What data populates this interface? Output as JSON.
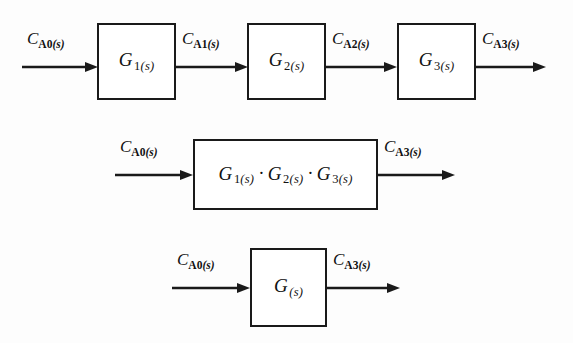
{
  "diagram": {
    "stroke_color": "#1a1a1a",
    "background_color": "#fdfdfd",
    "rows": [
      {
        "id": "row-cascade",
        "blocks": [
          {
            "id": "block-g1",
            "label_main": "G",
            "label_sub_num": "1",
            "label_sub_s": "(s)"
          },
          {
            "id": "block-g2",
            "label_main": "G",
            "label_sub_num": "2",
            "label_sub_s": "(s)"
          },
          {
            "id": "block-g3",
            "label_main": "G",
            "label_sub_num": "3",
            "label_sub_s": "(s)"
          }
        ],
        "signals": [
          {
            "id": "signal-ca0-top",
            "main": "C",
            "sub_bold": "A0",
            "sub_italic": "(s)"
          },
          {
            "id": "signal-ca1",
            "main": "C",
            "sub_bold": "A1",
            "sub_italic": "(s)"
          },
          {
            "id": "signal-ca2",
            "main": "C",
            "sub_bold": "A2",
            "sub_italic": "(s)"
          },
          {
            "id": "signal-ca3-top",
            "main": "C",
            "sub_bold": "A3",
            "sub_italic": "(s)"
          }
        ]
      },
      {
        "id": "row-product",
        "block": {
          "id": "block-product",
          "terms": [
            {
              "main": "G",
              "sub_num": "1",
              "sub_s": "(s)"
            },
            {
              "main": "G",
              "sub_num": "2",
              "sub_s": "(s)"
            },
            {
              "main": "G",
              "sub_num": "3",
              "sub_s": "(s)"
            }
          ],
          "separator": "·"
        },
        "signals": [
          {
            "id": "signal-ca0-mid",
            "main": "C",
            "sub_bold": "A0",
            "sub_italic": "(s)"
          },
          {
            "id": "signal-ca3-mid",
            "main": "C",
            "sub_bold": "A3",
            "sub_italic": "(s)"
          }
        ]
      },
      {
        "id": "row-equivalent",
        "block": {
          "id": "block-g",
          "label_main": "G",
          "label_sub_num": "",
          "label_sub_s": "(s)"
        },
        "signals": [
          {
            "id": "signal-ca0-bottom",
            "main": "C",
            "sub_bold": "A0",
            "sub_italic": "(s)"
          },
          {
            "id": "signal-ca3-bottom",
            "main": "C",
            "sub_bold": "A3",
            "sub_italic": "(s)"
          }
        ]
      }
    ]
  }
}
